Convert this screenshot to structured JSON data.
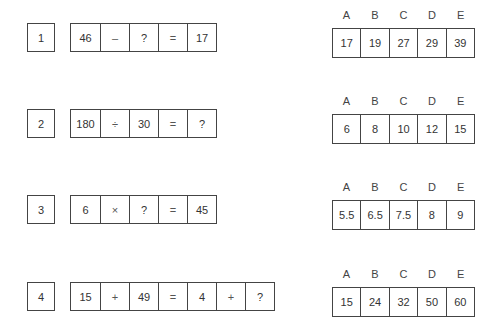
{
  "questions": [
    {
      "number": "1",
      "equation": [
        "46",
        "–",
        "?",
        "=",
        "17"
      ],
      "option_labels": [
        "A",
        "B",
        "C",
        "D",
        "E"
      ],
      "options": [
        "17",
        "19",
        "27",
        "29",
        "39"
      ]
    },
    {
      "number": "2",
      "equation": [
        "180",
        "÷",
        "30",
        "=",
        "?"
      ],
      "option_labels": [
        "A",
        "B",
        "C",
        "D",
        "E"
      ],
      "options": [
        "6",
        "8",
        "10",
        "12",
        "15"
      ]
    },
    {
      "number": "3",
      "equation": [
        "6",
        "×",
        "?",
        "=",
        "45"
      ],
      "option_labels": [
        "A",
        "B",
        "C",
        "D",
        "E"
      ],
      "options": [
        "5.5",
        "6.5",
        "7.5",
        "8",
        "9"
      ]
    },
    {
      "number": "4",
      "equation": [
        "15",
        "+",
        "49",
        "=",
        "4",
        "+",
        "?"
      ],
      "option_labels": [
        "A",
        "B",
        "C",
        "D",
        "E"
      ],
      "options": [
        "15",
        "24",
        "32",
        "50",
        "60"
      ]
    }
  ]
}
